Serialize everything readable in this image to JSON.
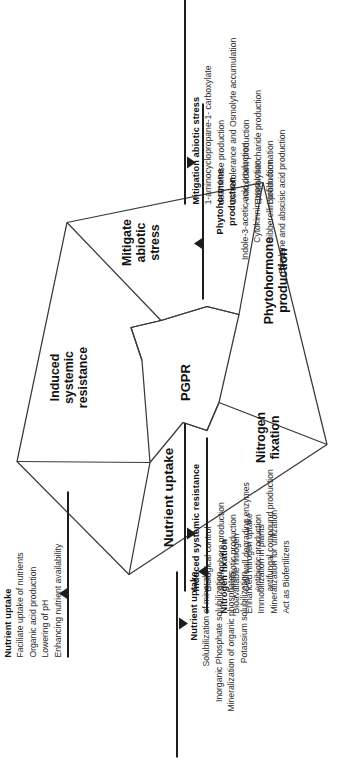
{
  "figure": {
    "center_label": "PGPR",
    "segments": [
      {
        "id": "nutrient-uptake",
        "label": "Nutrient uptake"
      },
      {
        "id": "induced-systemic-resistance",
        "label": "Induced\nsystemic\nresistance"
      },
      {
        "id": "mitigate-abiotic-stress",
        "label": "Mitigate\nabiotic\nstress"
      },
      {
        "id": "phytohormone-production",
        "label": "Phytohormone\nproduction"
      },
      {
        "id": "nitrogen-fixation",
        "label": "Nitrogen\nfixation"
      }
    ],
    "callouts": [
      {
        "id": "nutrient-uptake-top",
        "heading": "Nutrient uptake",
        "items": [
          "Faciliate uptake of nutrients",
          "Organic acid production",
          "Lowering of pH",
          "Enhancing nutrient availability"
        ]
      },
      {
        "id": "induced-systemic-resistance",
        "heading": "Induced systemic resistance",
        "items": [
          "Biological control",
          "Siderophore production",
          "Antibiotic production",
          "Cell wall degrading enzymes",
          "Antibiotic production",
          "antifungal compound production"
        ]
      },
      {
        "id": "mitigation-abiotic-stress",
        "heading": "Mitigation abiotic stress",
        "items": [
          "1-aminocyclopropane-1- carboxylate",
          "deaminase production",
          "Osmotolerance and Osmolyte accumulation",
          "Antioxidant production",
          "Exopolysaccharide production",
          "Biofilm formation"
        ]
      },
      {
        "id": "nutrient-uptake-bottom",
        "heading": "Nutrient uptake",
        "items": [
          "Solubilization of minerals",
          "Inorganic  Phosphate solubilization",
          "Mineralization of organic phosphates",
          "Potassium solubilization"
        ]
      },
      {
        "id": "nitrogen-fixation",
        "heading": "Nitrogen fixation",
        "items": [
          "Bioavailable nitrogen",
          "Enhanced nitrogen uptake",
          "Immobilization in plants",
          "Mineralization for utilization",
          "Act as Biofertilizers"
        ]
      },
      {
        "id": "phytohormone-production",
        "heading": "Phytohormone\nproduction",
        "items": [
          "Indole-3-acetic acid production",
          "Cytokinnin production",
          "Gibberellin production",
          "Ethylene and abscisic acid production"
        ]
      }
    ],
    "colors": {
      "stroke": "#3a3a3a",
      "rule": "#1d1d1d",
      "text": "#1a1a1a",
      "background": "#ffffff"
    }
  }
}
